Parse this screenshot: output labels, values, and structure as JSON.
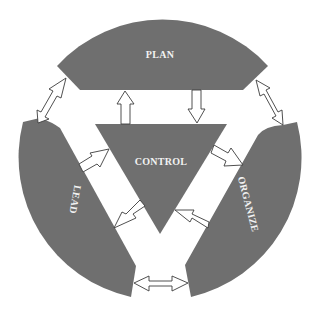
{
  "diagram": {
    "segment_color": "#6f6f6f",
    "background_color": "#ffffff",
    "nodes": [
      {
        "id": "plan",
        "label": "PLAN",
        "position": "top"
      },
      {
        "id": "control",
        "label": "CONTROL",
        "position": "center"
      },
      {
        "id": "lead",
        "label": "LEAD",
        "position": "lower-left"
      },
      {
        "id": "organize",
        "label": "ORGANIZE",
        "position": "lower-right"
      }
    ],
    "edges": [
      {
        "from": "plan",
        "to": "lead",
        "type": "bidirectional"
      },
      {
        "from": "plan",
        "to": "organize",
        "type": "bidirectional"
      },
      {
        "from": "lead",
        "to": "organize",
        "type": "bidirectional"
      },
      {
        "from": "control",
        "to": "plan",
        "type": "directed"
      },
      {
        "from": "plan",
        "to": "control",
        "type": "directed"
      },
      {
        "from": "lead",
        "to": "control",
        "type": "directed"
      },
      {
        "from": "control",
        "to": "lead",
        "type": "directed"
      },
      {
        "from": "control",
        "to": "organize",
        "type": "directed"
      },
      {
        "from": "organize",
        "to": "control",
        "type": "directed"
      }
    ]
  }
}
